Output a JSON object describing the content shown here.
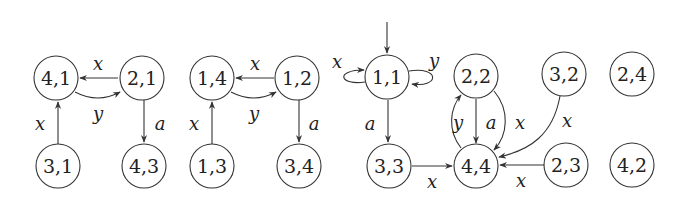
{
  "diagram": {
    "type": "state-transition-graph",
    "nodes": [
      {
        "id": "n41",
        "label": "4,1"
      },
      {
        "id": "n21",
        "label": "2,1"
      },
      {
        "id": "n31",
        "label": "3,1"
      },
      {
        "id": "n43",
        "label": "4,3"
      },
      {
        "id": "n14",
        "label": "1,4"
      },
      {
        "id": "n12",
        "label": "1,2"
      },
      {
        "id": "n13",
        "label": "1,3"
      },
      {
        "id": "n34",
        "label": "3,4"
      },
      {
        "id": "n11",
        "label": "1,1"
      },
      {
        "id": "n22",
        "label": "2,2"
      },
      {
        "id": "n32",
        "label": "3,2"
      },
      {
        "id": "n24",
        "label": "2,4"
      },
      {
        "id": "n33",
        "label": "3,3"
      },
      {
        "id": "n44",
        "label": "4,4"
      },
      {
        "id": "n23",
        "label": "2,3"
      },
      {
        "id": "n42",
        "label": "4,2"
      }
    ],
    "edges": [
      {
        "from": "2,1",
        "to": "4,1",
        "label": "x"
      },
      {
        "from": "4,1",
        "to": "2,1",
        "label": "y"
      },
      {
        "from": "3,1",
        "to": "4,1",
        "label": "x"
      },
      {
        "from": "2,1",
        "to": "4,3",
        "label": "a"
      },
      {
        "from": "1,2",
        "to": "1,4",
        "label": "x"
      },
      {
        "from": "1,4",
        "to": "1,2",
        "label": "y"
      },
      {
        "from": "1,3",
        "to": "1,4",
        "label": "x"
      },
      {
        "from": "1,2",
        "to": "3,4",
        "label": "a"
      },
      {
        "from": "1,1",
        "to": "1,1",
        "label": "x"
      },
      {
        "from": "1,1",
        "to": "1,1",
        "label": "y"
      },
      {
        "from": "1,1",
        "to": "3,3",
        "label": "a"
      },
      {
        "from": "3,3",
        "to": "4,4",
        "label": "x"
      },
      {
        "from": "4,4",
        "to": "2,2",
        "label": "y"
      },
      {
        "from": "2,2",
        "to": "4,4",
        "label": "a"
      },
      {
        "from": "2,2",
        "to": "4,4",
        "label": "x"
      },
      {
        "from": "3,2",
        "to": "4,4",
        "label": "x"
      },
      {
        "from": "2,3",
        "to": "4,4",
        "label": "x"
      }
    ],
    "initial_state": "1,1",
    "labels": {
      "x": "x",
      "y": "y",
      "a": "a"
    }
  }
}
